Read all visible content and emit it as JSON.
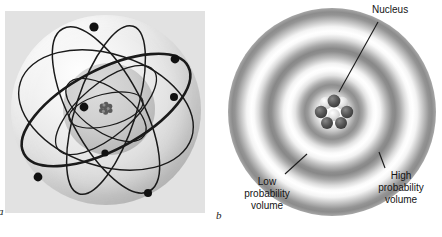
{
  "figure": {
    "caption_letters": {
      "panel_a": "a",
      "panel_b": "b"
    },
    "background_color": "#ffffff"
  },
  "panel_a": {
    "name": "bohr-planetary-atomic-model",
    "description": "Atom drawn as a translucent sphere crossed by several elliptical electron orbits with electrons shown as solid dots, surrounding a small dense nucleus",
    "panel_background_color": "#e2e2e2",
    "orbit_count": 6,
    "electron_count": 7,
    "orbit_color": "#1a1a1a",
    "electron_color": "#111111",
    "nucleus_color": "#5a5a5a"
  },
  "panel_b": {
    "name": "quantum-probability-cloud-model",
    "description": "Atom drawn as concentric fuzzy grey rings of electron probability density around a central nucleus cluster of protons and neutrons",
    "ring_count": 4,
    "ring_color_dark": "#8c8c8c",
    "ring_color_light": "#ffffff",
    "labels": {
      "nucleus": "Nucleus",
      "low_probability": "Low\nprobability\nvolume",
      "low_probability_line1": "Low",
      "low_probability_line2": "probability",
      "low_probability_line3": "volume",
      "high_probability_line1": "High",
      "high_probability_line2": "probability",
      "high_probability_line3": "volume"
    },
    "nucleus_particles": {
      "proton_color": "#4a4a4a",
      "neutron_color": "#d8d8d8",
      "count": 9
    }
  }
}
